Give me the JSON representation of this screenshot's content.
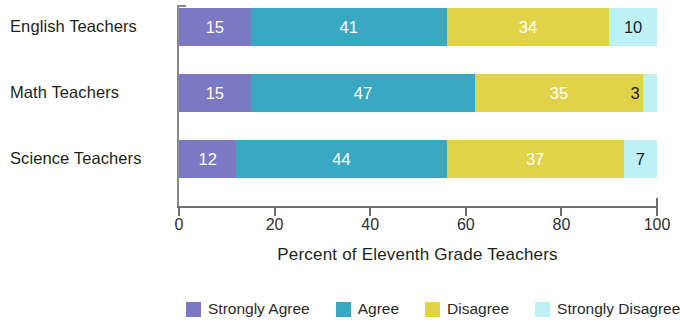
{
  "chart_data": {
    "type": "bar",
    "orientation": "horizontal",
    "stacked": true,
    "normalized_percent": true,
    "title": "",
    "xlabel": "Percent of Eleventh Grade Teachers",
    "ylabel": "",
    "xlim": [
      0,
      100
    ],
    "xticks": [
      0,
      20,
      40,
      60,
      80,
      100
    ],
    "xtick_labels": [
      "0",
      "20",
      "40",
      "60",
      "80",
      "100"
    ],
    "grid": false,
    "legend_position": "bottom",
    "categories": [
      "English Teachers",
      "Math Teachers",
      "Science Teachers"
    ],
    "series": [
      {
        "name": "Strongly Agree",
        "color": "#7b79c4",
        "values": [
          15,
          15,
          12
        ]
      },
      {
        "name": "Agree",
        "color": "#3aa8c1",
        "values": [
          41,
          47,
          44
        ]
      },
      {
        "name": "Disagree",
        "color": "#e0d34a",
        "values": [
          34,
          35,
          37
        ]
      },
      {
        "name": "Strongly Disagree",
        "color": "#bdf1f6",
        "values": [
          10,
          3,
          7
        ]
      }
    ],
    "bars": [
      {
        "category": "English Teachers",
        "segments": [
          {
            "label": "Strongly Agree",
            "value": 15,
            "value_text": "15",
            "color": "#7b79c4",
            "text_color": "#ffffff"
          },
          {
            "label": "Agree",
            "value": 41,
            "value_text": "41",
            "color": "#3aa8c1",
            "text_color": "#ffffff"
          },
          {
            "label": "Disagree",
            "value": 34,
            "value_text": "34",
            "color": "#e0d34a",
            "text_color": "#ffffff"
          },
          {
            "label": "Strongly Disagree",
            "value": 10,
            "value_text": "10",
            "color": "#bdf1f6",
            "text_color": "#1d1d1d"
          }
        ]
      },
      {
        "category": "Math Teachers",
        "segments": [
          {
            "label": "Strongly Agree",
            "value": 15,
            "value_text": "15",
            "color": "#7b79c4",
            "text_color": "#ffffff"
          },
          {
            "label": "Agree",
            "value": 47,
            "value_text": "47",
            "color": "#3aa8c1",
            "text_color": "#ffffff"
          },
          {
            "label": "Disagree",
            "value": 35,
            "value_text": "35",
            "color": "#e0d34a",
            "text_color": "#ffffff"
          },
          {
            "label": "Strongly Disagree",
            "value": 3,
            "value_text": "3",
            "color": "#bdf1f6",
            "text_color": "#1d1d1d"
          }
        ]
      },
      {
        "category": "Science Teachers",
        "segments": [
          {
            "label": "Strongly Agree",
            "value": 12,
            "value_text": "12",
            "color": "#7b79c4",
            "text_color": "#ffffff"
          },
          {
            "label": "Agree",
            "value": 44,
            "value_text": "44",
            "color": "#3aa8c1",
            "text_color": "#ffffff"
          },
          {
            "label": "Disagree",
            "value": 37,
            "value_text": "37",
            "color": "#e0d34a",
            "text_color": "#ffffff"
          },
          {
            "label": "Strongly Disagree",
            "value": 7,
            "value_text": "7",
            "color": "#bdf1f6",
            "text_color": "#1d1d1d"
          }
        ]
      }
    ],
    "legend": [
      {
        "label": "Strongly Agree",
        "color": "#7b79c4"
      },
      {
        "label": "Agree",
        "color": "#3aa8c1"
      },
      {
        "label": "Disagree",
        "color": "#e0d34a"
      },
      {
        "label": "Strongly Disagree",
        "color": "#bdf1f6"
      }
    ]
  },
  "axis": {
    "x_title": "Percent of Eleventh Grade Teachers",
    "tick_labels": [
      "0",
      "20",
      "40",
      "60",
      "80",
      "100"
    ]
  }
}
